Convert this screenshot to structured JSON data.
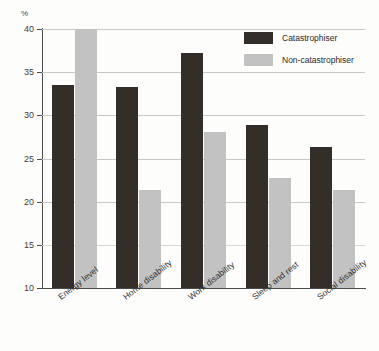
{
  "chart_data": {
    "type": "bar",
    "title": "",
    "xlabel": "",
    "ylabel": "%",
    "ylim": [
      10,
      40
    ],
    "yticks": [
      10,
      15,
      20,
      25,
      30,
      35,
      40
    ],
    "grid": true,
    "legend_position": "top-right",
    "categories": [
      "Energy level",
      "Home disability",
      "Work disability",
      "Sleep and rest",
      "Social disability"
    ],
    "series": [
      {
        "name": "Catastrophiser",
        "color": "#332e2a",
        "values": [
          33.5,
          33.3,
          37.2,
          28.9,
          26.3
        ]
      },
      {
        "name": "Non-catastrophiser",
        "color": "#c2c2c2",
        "values": [
          40.0,
          21.4,
          28.1,
          22.7,
          21.4
        ]
      }
    ]
  },
  "axis": {
    "unit_label": "%",
    "tick_labels": [
      "40",
      "35",
      "30",
      "25",
      "20",
      "15",
      "10"
    ]
  },
  "legend": {
    "items": [
      {
        "label": "Catastrophiser",
        "swatch": "dark-swatch"
      },
      {
        "label": "Non-catastrophiser",
        "swatch": "light-swatch"
      }
    ]
  }
}
